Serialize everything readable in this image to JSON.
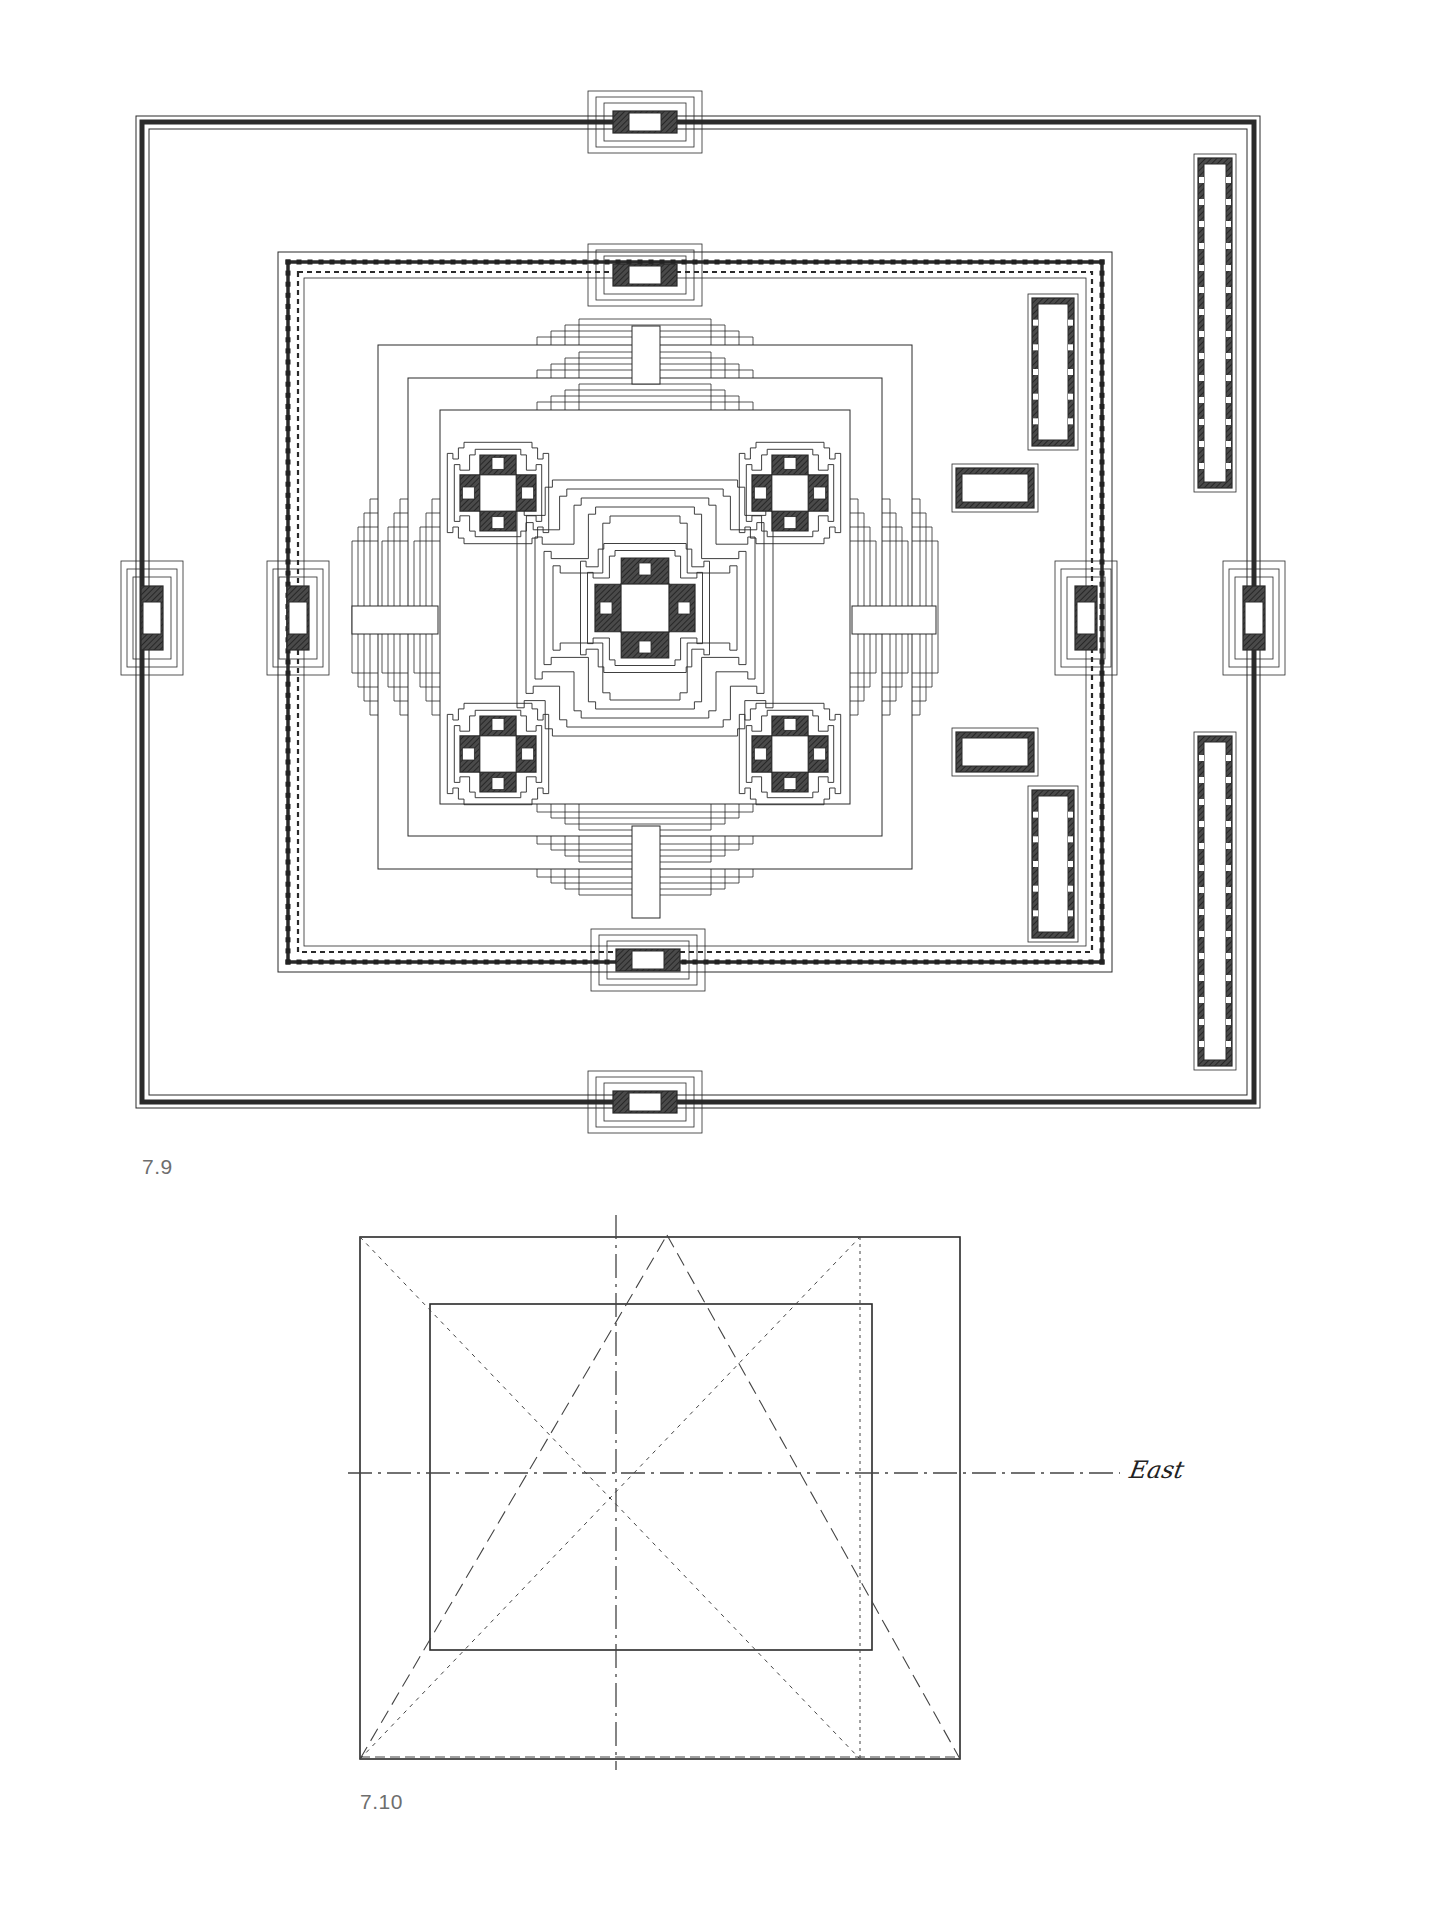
{
  "page": {
    "background": "#ffffff",
    "ink": "#2a2a2a",
    "hatch": "#3a3a3a"
  },
  "figure_7_9": {
    "caption": "7.9",
    "title": "Temple complex site plan",
    "outer_enclosure": {
      "x": 142,
      "y": 122,
      "w": 1112,
      "h": 980
    },
    "middle_enclosure": {
      "x": 288,
      "y": 262,
      "w": 814,
      "h": 700
    },
    "terraces": [
      {
        "x": 378,
        "y": 345,
        "w": 534,
        "h": 524
      },
      {
        "x": 408,
        "y": 378,
        "w": 474,
        "h": 458
      },
      {
        "x": 440,
        "y": 410,
        "w": 410,
        "h": 394
      }
    ],
    "central_shrine": {
      "cx": 645,
      "cy": 608,
      "arm": 92
    },
    "corner_shrines": [
      {
        "cx": 498,
        "cy": 493
      },
      {
        "cx": 790,
        "cy": 493
      },
      {
        "cx": 498,
        "cy": 754
      },
      {
        "cx": 790,
        "cy": 754
      }
    ],
    "gopuras": [
      {
        "name": "outer-north",
        "cx": 645,
        "cy": 122,
        "orient": "h"
      },
      {
        "name": "outer-south",
        "cx": 645,
        "cy": 1102,
        "orient": "h"
      },
      {
        "name": "outer-west",
        "cx": 152,
        "cy": 618,
        "orient": "v"
      },
      {
        "name": "outer-east",
        "cx": 1254,
        "cy": 618,
        "orient": "v"
      },
      {
        "name": "middle-north",
        "cx": 645,
        "cy": 275,
        "orient": "h"
      },
      {
        "name": "middle-south",
        "cx": 648,
        "cy": 960,
        "orient": "h"
      },
      {
        "name": "middle-west",
        "cx": 298,
        "cy": 618,
        "orient": "v"
      },
      {
        "name": "middle-east",
        "cx": 1086,
        "cy": 618,
        "orient": "v"
      }
    ],
    "causeways": [
      {
        "x": 632,
        "y": 326,
        "w": 28,
        "h": 58
      },
      {
        "x": 632,
        "y": 826,
        "w": 28,
        "h": 92
      },
      {
        "x": 352,
        "y": 606,
        "w": 86,
        "h": 28
      },
      {
        "x": 852,
        "y": 606,
        "w": 84,
        "h": 28
      }
    ],
    "libraries": [
      {
        "x": 1032,
        "y": 298,
        "w": 42,
        "h": 148
      },
      {
        "x": 1032,
        "y": 790,
        "w": 42,
        "h": 148
      },
      {
        "x": 956,
        "y": 468,
        "w": 78,
        "h": 40
      },
      {
        "x": 956,
        "y": 732,
        "w": 78,
        "h": 40
      }
    ],
    "galleries": [
      {
        "x": 1198,
        "y": 158,
        "w": 34,
        "h": 330
      },
      {
        "x": 1198,
        "y": 736,
        "w": 34,
        "h": 330
      }
    ]
  },
  "figure_7_10": {
    "caption": "7.10",
    "title": "Proportioning diagram",
    "outer_rect": {
      "x": 360,
      "y": 1237,
      "w": 600,
      "h": 522
    },
    "inner_rect": {
      "x": 430,
      "y": 1304,
      "w": 442,
      "h": 346
    },
    "center": {
      "x": 616,
      "y": 1473
    },
    "axis_vertical": {
      "x": 616,
      "y1": 1215,
      "y2": 1770
    },
    "axis_horizontal": {
      "y": 1473,
      "x1": 348,
      "x2": 1120
    },
    "apex": {
      "x": 667,
      "y": 1235
    },
    "east_label": "East"
  }
}
